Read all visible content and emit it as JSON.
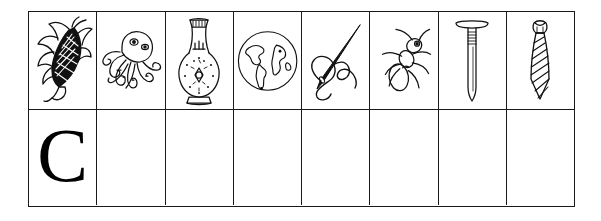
{
  "worksheet": {
    "columns": 8,
    "rows": 2,
    "border_color": "#1a1a1a",
    "background_color": "#ffffff",
    "ink_color": "#000000",
    "picture_row": {
      "cells": [
        {
          "icon": "corn-icon",
          "label": "corn"
        },
        {
          "icon": "octopus-icon",
          "label": "octopus"
        },
        {
          "icon": "vase-icon",
          "label": "vase"
        },
        {
          "icon": "globe-icon",
          "label": "globe"
        },
        {
          "icon": "needle-and-thread-icon",
          "label": "needle and thread"
        },
        {
          "icon": "ant-icon",
          "label": "ant"
        },
        {
          "icon": "nail-icon",
          "label": "nail"
        },
        {
          "icon": "necktie-icon",
          "label": "necktie"
        }
      ]
    },
    "letter_row": {
      "cells": [
        {
          "letter": "C"
        },
        {
          "letter": ""
        },
        {
          "letter": ""
        },
        {
          "letter": ""
        },
        {
          "letter": ""
        },
        {
          "letter": ""
        },
        {
          "letter": ""
        },
        {
          "letter": ""
        }
      ]
    }
  }
}
